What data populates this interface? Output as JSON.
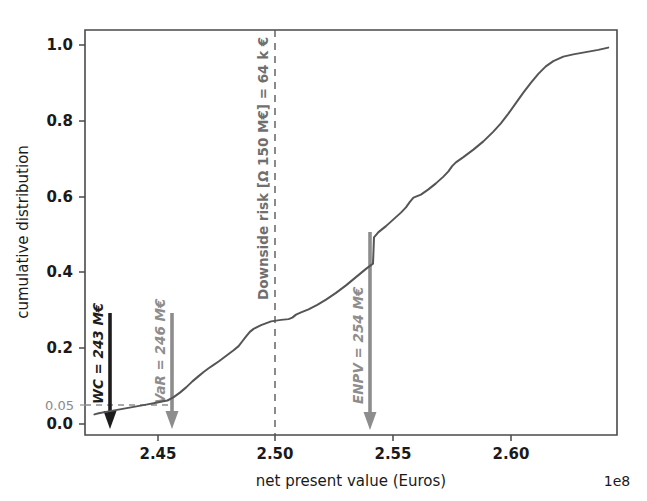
{
  "chart_data": {
    "type": "line",
    "title": "",
    "xlabel": "net present value (Euros)",
    "ylabel": "cumulative distribution",
    "x_exponent_label": "1e8",
    "xlim": [
      2.4245,
      2.6375
    ],
    "ylim": [
      -0.035,
      1.045
    ],
    "grid": false,
    "legend": null,
    "xticks": [
      "2.45",
      "2.50",
      "2.55",
      "2.60"
    ],
    "xtick_values": [
      2.45,
      2.5,
      2.55,
      2.6
    ],
    "yticks": [
      "0.0",
      "0.2",
      "0.4",
      "0.6",
      "0.8",
      "1.0"
    ],
    "ytick_values": [
      0.0,
      0.2,
      0.4,
      0.6,
      0.8,
      1.0
    ],
    "extra_ytick": {
      "label": "0.05",
      "value": 0.05,
      "color": "#8a8a8a"
    },
    "series": [
      {
        "name": "cumulative distribution of net present value",
        "color": "#555555",
        "x": [
          2.4283,
          2.43,
          2.434,
          2.439,
          2.444,
          2.449,
          2.453,
          2.4558,
          2.4575,
          2.46,
          2.4625,
          2.465,
          2.4675,
          2.47,
          2.472,
          2.474,
          2.476,
          2.478,
          2.48,
          2.482,
          2.484,
          2.486,
          2.4875,
          2.489,
          2.4905,
          2.492,
          2.495,
          2.499,
          2.503,
          2.506,
          2.5075,
          2.509,
          2.511,
          2.514,
          2.5175,
          2.521,
          2.525,
          2.529,
          2.533,
          2.537,
          2.5398,
          2.54,
          2.5402,
          2.542,
          2.545,
          2.548,
          2.551,
          2.553,
          2.5545,
          2.556,
          2.559,
          2.562,
          2.565,
          2.568,
          2.57,
          2.5715,
          2.573,
          2.576,
          2.58,
          2.584,
          2.588,
          2.591,
          2.594,
          2.597,
          2.6,
          2.603,
          2.606,
          2.609,
          2.612,
          2.616,
          2.62,
          2.625,
          2.63,
          2.634
        ],
        "y": [
          0.02,
          0.023,
          0.028,
          0.034,
          0.04,
          0.046,
          0.051,
          0.055,
          0.057,
          0.066,
          0.078,
          0.092,
          0.108,
          0.122,
          0.133,
          0.143,
          0.152,
          0.161,
          0.171,
          0.181,
          0.191,
          0.202,
          0.215,
          0.228,
          0.24,
          0.248,
          0.258,
          0.268,
          0.272,
          0.274,
          0.278,
          0.286,
          0.292,
          0.3,
          0.312,
          0.326,
          0.344,
          0.364,
          0.386,
          0.408,
          0.422,
          0.455,
          0.492,
          0.506,
          0.522,
          0.54,
          0.558,
          0.572,
          0.586,
          0.598,
          0.606,
          0.62,
          0.636,
          0.654,
          0.668,
          0.682,
          0.692,
          0.706,
          0.726,
          0.748,
          0.774,
          0.796,
          0.822,
          0.85,
          0.878,
          0.904,
          0.928,
          0.948,
          0.962,
          0.974,
          0.98,
          0.986,
          0.992,
          0.998
        ]
      }
    ],
    "annotations": [
      {
        "id": "wc",
        "label": "WC = 243 M€",
        "x": 2.4283,
        "y_top": 0.293,
        "y_bottom": 0.0,
        "color": "#1d1d1d",
        "style": "arrow-down-bold-italic"
      },
      {
        "id": "var",
        "label": "VaR = 246 M€",
        "x": 2.4575,
        "y_top": 0.293,
        "y_bottom": 0.0,
        "color": "#8d8d8d",
        "style": "arrow-down-bold-italic"
      },
      {
        "id": "enpv",
        "label": "ENPV = 254 M€",
        "x": 2.54,
        "y_top": 0.508,
        "y_bottom": 0.0,
        "color": "#8d8d8d",
        "style": "arrow-down-bold-italic"
      },
      {
        "id": "downside-risk",
        "label": "Downside risk [Ω 150 M€] = 64 k €",
        "x": 2.5,
        "y_top": 1.045,
        "y_bottom": -0.035,
        "color": "#5a5a5a",
        "style": "vertical-dashed-line"
      },
      {
        "id": "percentile-5",
        "label": "0.05",
        "y": 0.05,
        "x_from": 2.4245,
        "x_to": 2.46,
        "color": "#8d8d8d",
        "style": "horizontal-dashed-line"
      }
    ]
  }
}
